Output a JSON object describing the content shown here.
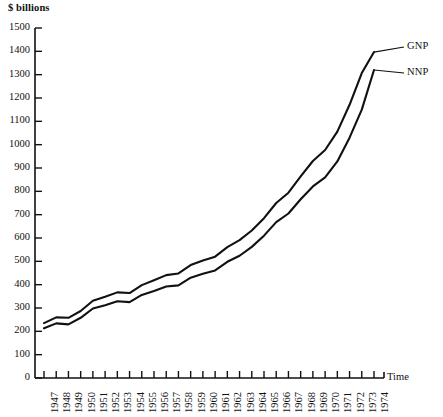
{
  "chart_data": {
    "type": "line",
    "title": "",
    "subtitle": "",
    "xlabel": "Time",
    "ylabel": "$ billions",
    "ylim": [
      0,
      1500
    ],
    "ytick_step": 100,
    "grid": false,
    "legend_position": "right-inline-end-of-line",
    "yticks": [
      "1500",
      "1400",
      "1300",
      "1200",
      "1100",
      "1000",
      "900",
      "800",
      "700",
      "600",
      "500",
      "400",
      "300",
      "200",
      "100",
      "0"
    ],
    "categories": [
      "1947",
      "1948",
      "1949",
      "1950",
      "1951",
      "1952",
      "1953",
      "1954",
      "1955",
      "1956",
      "1957",
      "1958",
      "1959",
      "1960",
      "1961",
      "1962",
      "1963",
      "1964",
      "1965",
      "1966",
      "1967",
      "1968",
      "1969",
      "1970",
      "1971",
      "1972",
      "1973",
      "1974"
    ],
    "series": [
      {
        "name": "GNP",
        "color": "#111111",
        "values": [
          235,
          260,
          258,
          287,
          331,
          348,
          367,
          364,
          398,
          419,
          441,
          448,
          484,
          504,
          520,
          561,
          591,
          632,
          685,
          750,
          794,
          864,
          930,
          977,
          1056,
          1171,
          1307,
          1397
        ]
      },
      {
        "name": "NNP",
        "color": "#111111",
        "values": [
          213,
          234,
          230,
          258,
          298,
          312,
          329,
          325,
          356,
          373,
          392,
          397,
          430,
          447,
          461,
          498,
          524,
          562,
          610,
          668,
          705,
          766,
          821,
          860,
          928,
          1030,
          1150,
          1320
        ]
      }
    ]
  },
  "axis": {
    "y_unit": "$ billions",
    "x_axis_title": "Time"
  },
  "labels": {
    "gnp": "GNP",
    "nnp": "NNP"
  }
}
